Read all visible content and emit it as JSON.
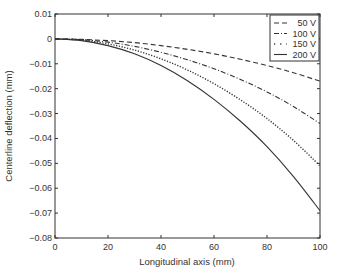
{
  "chart_data": {
    "type": "line",
    "title": "",
    "xlabel": "Longitudinal axis (mm)",
    "ylabel": "Centerline deflection (mm)",
    "xlim": [
      0,
      100
    ],
    "ylim": [
      -0.08,
      0.01
    ],
    "xticks": [
      0,
      20,
      40,
      60,
      80,
      100
    ],
    "yticks": [
      0.01,
      0,
      -0.01,
      -0.02,
      -0.03,
      -0.04,
      -0.05,
      -0.06,
      -0.07,
      -0.08
    ],
    "ytick_labels": [
      "0.01",
      "0",
      "-0.01",
      "-0.02",
      "-0.03",
      "-0.04",
      "-0.05",
      "-0.06",
      "-0.07",
      "-0.08"
    ],
    "grid": false,
    "legend_position": "upper right",
    "x": [
      0,
      10,
      20,
      30,
      40,
      50,
      60,
      70,
      80,
      90,
      100
    ],
    "series": [
      {
        "name": "50 V",
        "style": "dashed",
        "values": [
          0,
          -0.0002,
          -0.0007,
          -0.0015,
          -0.0027,
          -0.0042,
          -0.006,
          -0.0082,
          -0.0107,
          -0.0136,
          -0.017
        ]
      },
      {
        "name": "100 V",
        "style": "dashdot",
        "values": [
          0,
          -0.0003,
          -0.0013,
          -0.003,
          -0.0054,
          -0.0084,
          -0.012,
          -0.0163,
          -0.0213,
          -0.0272,
          -0.034
        ]
      },
      {
        "name": "150 V",
        "style": "dotted",
        "values": [
          0,
          -0.0005,
          -0.002,
          -0.0045,
          -0.008,
          -0.0125,
          -0.018,
          -0.0245,
          -0.032,
          -0.0408,
          -0.051
        ]
      },
      {
        "name": "200 V",
        "style": "solid",
        "values": [
          0,
          -0.0007,
          -0.0027,
          -0.006,
          -0.0107,
          -0.0168,
          -0.0243,
          -0.0331,
          -0.0433,
          -0.0553,
          -0.069
        ]
      }
    ]
  }
}
